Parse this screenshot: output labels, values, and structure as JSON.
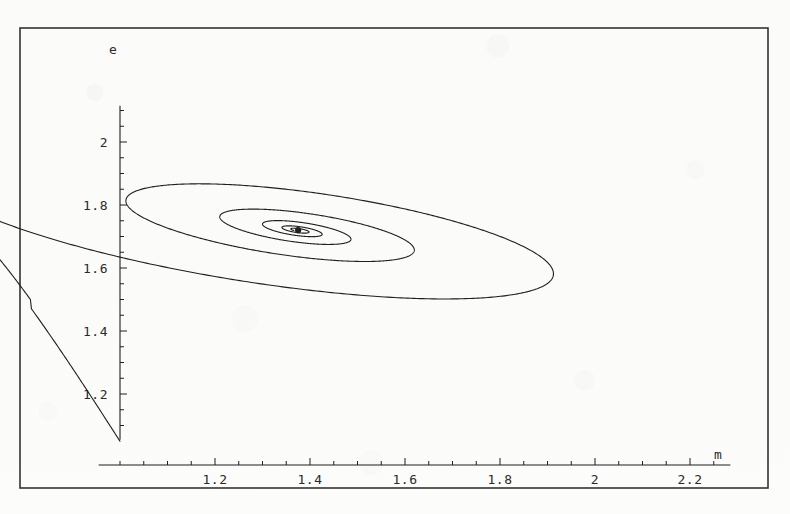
{
  "figure": {
    "name": "phase-portrait-spiral",
    "background_color": "#fdfdfc",
    "line_color": "#1f1f1f",
    "frame_color": "#333333",
    "frame": {
      "x": 20,
      "y": 28,
      "width": 748,
      "height": 460
    }
  },
  "chart_data": {
    "type": "line",
    "title": "",
    "subtitle": "",
    "xlabel": "m",
    "ylabel": "e",
    "grid": false,
    "legend": null,
    "annotations": [],
    "xlim": [
      0.95,
      2.32
    ],
    "ylim": [
      1.04,
      2.24
    ],
    "xticks": [
      1.2,
      1.4,
      1.6,
      1.8,
      2.0,
      2.2
    ],
    "xticklabels": [
      "1.2",
      "1.4",
      "1.6",
      "1.8",
      "2",
      "2.2"
    ],
    "yticks": [
      1.2,
      1.4,
      1.6,
      1.8,
      2.0
    ],
    "yticklabels": [
      "1.2",
      "1.4",
      "1.6",
      "1.8",
      "2"
    ],
    "x_minor_tick_step": 0.05,
    "y_minor_tick_step": 0.05,
    "axis_origin": {
      "m": 1.0,
      "e": 1.05
    },
    "fixed_point": {
      "m": 1.375,
      "e": 1.72
    },
    "spiral": {
      "center_m": 1.375,
      "center_e": 1.72,
      "tilt_degrees": -13.5,
      "start_theta_degrees": 196,
      "start_semi_major": 0.79,
      "start_semi_minor": 0.215,
      "decay_per_turn": 0.455,
      "turns": 5.1,
      "axis_ratio_note": "semi-minor/semi-major held constant while radius decays"
    },
    "inbound_segment": {
      "description": "initial transient rising from the axis origin up to the outer loop",
      "start": {
        "m": 1.0,
        "e": 1.05
      },
      "via": [
        {
          "m": 1.35,
          "e": 1.23
        },
        {
          "m": 1.7,
          "e": 1.39
        },
        {
          "m": 2.0,
          "e": 1.53
        }
      ],
      "end": {
        "m": 2.2,
        "e": 1.66
      }
    },
    "outer_loop_extremes": {
      "leftmost": {
        "m": 0.98,
        "e": 1.6
      },
      "rightmost": {
        "m": 2.21,
        "e": 1.78
      },
      "topmost": {
        "m": 1.46,
        "e": 2.18
      },
      "bottommost": {
        "m": 1.28,
        "e": 1.43
      }
    },
    "series": [
      {
        "name": "trajectory",
        "color": "#1f1f1f",
        "linewidth": 1.1,
        "style": "solid"
      }
    ]
  },
  "labels": {
    "x_axis_variable": "m",
    "y_axis_variable": "e"
  }
}
